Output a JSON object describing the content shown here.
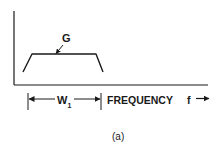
{
  "diagram": {
    "curve_label": "G",
    "width_label": "W",
    "width_subscript": "1",
    "axis_label": "FREQUENCY",
    "axis_variable": "f",
    "caption": "(a)",
    "colors": {
      "ink": "#1a1a1a",
      "background": "#ffffff"
    }
  }
}
